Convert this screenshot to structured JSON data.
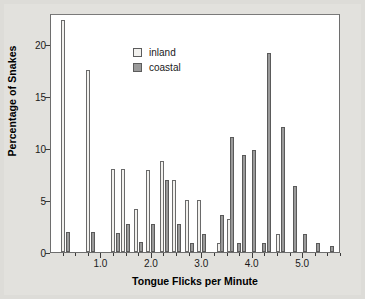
{
  "chart_data": {
    "type": "bar",
    "title": "",
    "xlabel": "Tongue Flicks per Minute",
    "ylabel": "Percentage of Snakes",
    "xlim": [
      0.0,
      5.75
    ],
    "ylim": [
      0,
      23
    ],
    "grid": false,
    "legend_position": "upper-center",
    "x_ticks": [
      "1.0",
      "2.0",
      "3.0",
      "4.0",
      "5.0"
    ],
    "x_tick_values": [
      1.0,
      2.0,
      3.0,
      4.0,
      5.0
    ],
    "y_ticks": [
      "0",
      "5",
      "10",
      "15",
      "20"
    ],
    "y_tick_values": [
      0,
      5,
      10,
      15,
      20
    ],
    "bar_width": 0.055,
    "series": [
      {
        "name": "inland",
        "color": "#f2f1ee",
        "x": [
          0.22,
          0.72,
          1.22,
          1.42,
          1.68,
          1.92,
          2.18,
          2.42,
          2.68,
          2.92,
          3.32,
          3.52,
          4.48
        ],
        "values": [
          22.3,
          17.5,
          8.0,
          8.0,
          4.1,
          7.9,
          8.8,
          6.9,
          5.0,
          5.0,
          0.9,
          3.2,
          1.7
        ]
      },
      {
        "name": "coastal",
        "color": "#9a9a9a",
        "x": [
          0.32,
          0.82,
          1.32,
          1.52,
          1.78,
          2.02,
          2.28,
          2.52,
          2.78,
          3.02,
          3.38,
          3.58,
          3.72,
          3.82,
          4.02,
          4.22,
          4.32,
          4.58,
          4.82,
          5.02,
          5.28,
          5.55
        ],
        "values": [
          1.9,
          1.9,
          1.8,
          2.7,
          1.0,
          2.7,
          6.9,
          2.7,
          0.9,
          1.7,
          3.6,
          11.1,
          0.9,
          9.3,
          9.8,
          0.9,
          19.2,
          12.0,
          6.4,
          1.7,
          0.9,
          0.6
        ]
      }
    ]
  },
  "legend": {
    "items": [
      {
        "label": "inland",
        "swatch": "inland"
      },
      {
        "label": "coastal",
        "swatch": "coastal"
      }
    ]
  }
}
